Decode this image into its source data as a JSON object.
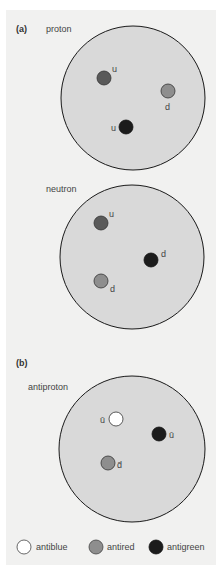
{
  "panels": {
    "a": {
      "label": "(a)",
      "particles": [
        {
          "name": "proton",
          "quarks": [
            {
              "symbol": "u",
              "color": "antired-dark",
              "fill": "#5a5a5a"
            },
            {
              "symbol": "d",
              "color": "mid",
              "fill": "#8e8e8e"
            },
            {
              "symbol": "u",
              "color": "dark",
              "fill": "#1c1c1c"
            }
          ]
        },
        {
          "name": "neutron",
          "quarks": [
            {
              "symbol": "u",
              "fill": "#5a5a5a"
            },
            {
              "symbol": "d",
              "fill": "#1c1c1c"
            },
            {
              "symbol": "d",
              "fill": "#8e8e8e"
            }
          ]
        }
      ]
    },
    "b": {
      "label": "(b)",
      "particles": [
        {
          "name": "antiproton",
          "quarks": [
            {
              "symbol": "ū",
              "fill": "#ffffff"
            },
            {
              "symbol": "ū",
              "fill": "#1c1c1c"
            },
            {
              "symbol": "d̄",
              "fill": "#8e8e8e"
            }
          ]
        }
      ]
    }
  },
  "legend": [
    {
      "label": "antiblue",
      "fill": "#ffffff"
    },
    {
      "label": "antired",
      "fill": "#8e8e8e"
    },
    {
      "label": "antigreen",
      "fill": "#1c1c1c"
    }
  ],
  "colors": {
    "background": "#f1f1f0",
    "circle_fill": "#d9d9d9",
    "circle_stroke": "#1a1a1a"
  }
}
